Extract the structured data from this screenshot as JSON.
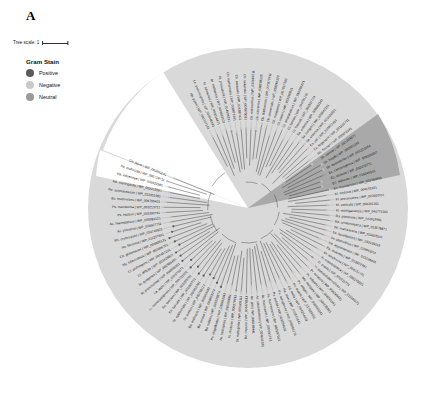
{
  "figure": {
    "panel_label": "A",
    "tree_scale_label": "Tree scale: 1",
    "legend": {
      "title": "Gram Stain",
      "items": [
        {
          "label": "Positive",
          "color": "#5a5a5a"
        },
        {
          "label": "Negative",
          "color": "#c9c9c9"
        },
        {
          "label": "Neutral",
          "color": "#9a9a9a"
        }
      ]
    },
    "colors": {
      "background_fan": "#d8d8d8",
      "highlight_sector": "#a8a8a8",
      "tree_lines": "#333333",
      "label_text": "#1a1a1a"
    },
    "leaves": [
      "Cb. sakazakii | WP_004387401",
      "Cb. sakazakii | WP_007873031",
      "Cb. malonaticus | WP_032987211",
      "Cb. turicensis | WP_038798125",
      "Cb. dublinensis | WP_007879411",
      "Cb. universalis | WP_039246123",
      "Cb. muytjensii | WP_007867392",
      "Ct. koseri | WP_023290011",
      "Ct. amalonaticus | WP_016156121",
      "Ct. farmeri | WP_044791101",
      "Ct. freundii | WP_003837724",
      "Sa. enterica | WP_000803341",
      "Sa. bongori | WP_020842211",
      "Sa. enterica | WP_001034991",
      "Es. coli | WP_000872451",
      "Es. fergusonii | WP_001201711",
      "Sh. flexneri | WP_000972341",
      "Sh. sonnei | WP_021304871",
      "Sh. boydii | WP_000901233",
      "Sh. dysenteriae | WP_001221654",
      "Ec. cancerogenus | WP_039291027",
      "Ec. cloacae | WP_032470771",
      "Ec. asburiae | WP_016249301",
      "Ec. hormaechei | WP_032359991",
      "Kl. oxytoca | WP_004152101",
      "Kl. pneumoniae | WP_002920111",
      "Kl. variicola | WP_004201161",
      "Kl. michiganensis | WP_044771103",
      "Ra. planticola | WP_032619991",
      "Ra. ornithinolytica | WP_013578871",
      "Se. marcescens | WP_033635311",
      "Se. liquefaciens | WP_033139119",
      "Se. plymuthica | WP_019843201",
      "Pa. agglomerans | WP_021236441",
      "Pa. ananatis | WP_013027701",
      "Er. amylovora | WP_004157741",
      "Yr. enterocolitica | WP_005170021",
      "Yr. pestis | WP_002211771",
      "Yr. pseudotuberculosis | WP_011191121",
      "Pr. mirabilis | WP_004246431",
      "Pr. vulgaris | WP_004245541",
      "Mo. morganii | WP_004235991",
      "Pv. rettgeri | WP_036933341",
      "Pv. stuartii | WP_017829011",
      "Ed. tarda | WP_004254431",
      "Ha. alvei | WP_016531641",
      "Ps. aeruginosa | WP_003091174",
      "Ps. putida | WP_003254031",
      "Ps. fluorescens | WP_003197021",
      "Ac. baumannii | WP_000991743",
      "Ac. calcoaceticus | WP_004643341",
      "Ac. pittii | WP_005199441",
      "Bu. cepacia | WP_006478511",
      "St. maltophilia | WP_005409111",
      "Vi. cholerae | WP_000179911",
      "Ae. hydrophila | WP_016350081",
      "Ps. shigelloides | WP_010862911",
      "Ba. subtilis | WP_003229874",
      "Ba. cereus | WP_000953074",
      "Ba. anthracis | WP_000919481",
      "St. aureus | WP_000799112",
      "St. epidermidis | WP_002455781",
      "En. faecalis | WP_002357771",
      "En. faecium | WP_002295791",
      "Li. monocytogenes | WP_003721101",
      "La. lactis | WP_011676371",
      "St. pneumoniae | WP_000698921",
      "St. pyogenes | WP_002985401",
      "Cl. difficile | WP_003428821",
      "Cl. perfringens | WP_003457241",
      "My. tuberculosis | WP_003406761",
      "Co. glutamicum | WP_003855131",
      "No. farcinica | WP_011207691",
      "Rh. erythropolis | WP_019749921",
      "Ac. johnsonii | WP_004927711",
      "Ac. haemolyticus | WP_005089121",
      "Ps. stutzeri | WP_003290741",
      "Ps. mendocina | WP_003213711",
      "Bu. multivorans | WP_006755421",
      "Ra. solanacearum | WP_011001981",
      "Ne. meningitidis | WP_002215591",
      "Ha. influenzae | WP_005632981",
      "Pa. multocida | WP_005719711",
      "Ca. jejuni | WP_002851141",
      "He. pylori | WP_000727161",
      "Le. pneumophila | WP_010946181",
      "Fr. tularensis | WP_003014471",
      "Br. melitensis | WP_004683101",
      "Ri. prowazekii | WP_004596331",
      "Ch. trachomatis | WP_009871941"
    ]
  }
}
